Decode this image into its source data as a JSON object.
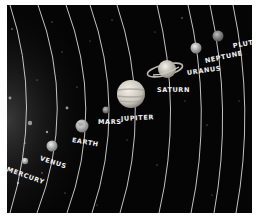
{
  "scene": {
    "title": "Solar system illustration",
    "background": "#050505",
    "orbit_color": "#d8d8d8"
  },
  "planets": [
    {
      "name": "MERCURY",
      "x": 18,
      "y": 156,
      "r": 3.2,
      "color": "#b9b9b9"
    },
    {
      "name": "VENUS",
      "x": 45,
      "y": 141,
      "r": 5.5,
      "color": "#c8c8c8"
    },
    {
      "name": "EARTH",
      "x": 75,
      "y": 121,
      "r": 6.5,
      "color": "#bdbdbd"
    },
    {
      "name": "MARS",
      "x": 99,
      "y": 105,
      "r": 3.5,
      "color": "#a8a8a8"
    },
    {
      "name": "JUPITER",
      "x": 124,
      "y": 89,
      "r": 14,
      "color": "#d0ccc4"
    },
    {
      "name": "SATURN",
      "x": 160,
      "y": 64,
      "r": 9,
      "color": "#d6d3cc"
    },
    {
      "name": "URANUS",
      "x": 189,
      "y": 43,
      "r": 5.5,
      "color": "#c9c9c9"
    },
    {
      "name": "NEPTUNE",
      "x": 211,
      "y": 31,
      "r": 5.5,
      "color": "#9a9a9a"
    },
    {
      "name": "PLUTO",
      "x": 234,
      "y": 25,
      "r": 0,
      "color": "#999999"
    }
  ],
  "labels": {
    "mercury": "MERCURY",
    "venus": "VENUS",
    "earth": "EARTH",
    "mars": "MARS",
    "jupiter": "JUPITER",
    "saturn": "SATURN",
    "uranus": "URANUS",
    "neptune": "NEPTUNE",
    "pluto": "PLUTO"
  }
}
